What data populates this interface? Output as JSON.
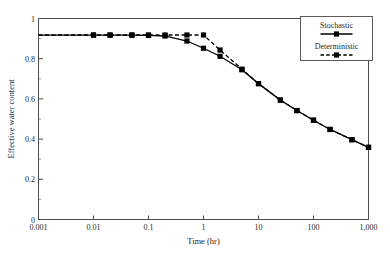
{
  "chart_data": {
    "type": "line",
    "title": "",
    "xlabel": "Time (hr)",
    "ylabel": "Effective water content",
    "xscale": "log",
    "yscale": "linear",
    "xlim": [
      0.001,
      1000
    ],
    "ylim": [
      0,
      1
    ],
    "grid": false,
    "legend_position": "top-right",
    "xticks": [
      0.001,
      0.01,
      0.1,
      1,
      10,
      100,
      1000
    ],
    "xticklabels": [
      "0.001",
      "0.01",
      "0.1",
      "1",
      "10",
      "100",
      "1,000"
    ],
    "yticks": [
      0,
      0.2,
      0.4,
      0.6,
      0.8,
      1
    ],
    "yticklabels": [
      "0",
      "0.2",
      "0.4",
      "0.6",
      "0.8",
      "1"
    ],
    "yminorticks": [
      0.1,
      0.3,
      0.5,
      0.7,
      0.9
    ],
    "series": [
      {
        "name": "Stochastic",
        "linestyle": "solid",
        "marker": "square",
        "color": "#000000",
        "x": [
          0.001,
          0.01,
          0.02,
          0.05,
          0.1,
          0.2,
          0.5,
          1,
          2,
          5,
          10,
          25,
          50,
          100,
          200,
          500,
          1000
        ],
        "y": [
          0.917,
          0.917,
          0.917,
          0.917,
          0.916,
          0.913,
          0.888,
          0.852,
          0.812,
          0.745,
          0.676,
          0.594,
          0.542,
          0.494,
          0.448,
          0.397,
          0.359
        ]
      },
      {
        "name": "Deterministic",
        "linestyle": "dashed",
        "marker": "square",
        "color": "#000000",
        "x": [
          0.001,
          0.01,
          0.02,
          0.05,
          0.1,
          0.2,
          0.5,
          1,
          2,
          5,
          10,
          25,
          50,
          100,
          200,
          500,
          1000
        ],
        "y": [
          0.918,
          0.918,
          0.918,
          0.918,
          0.918,
          0.918,
          0.918,
          0.918,
          0.843,
          0.748,
          0.676,
          0.594,
          0.542,
          0.494,
          0.448,
          0.397,
          0.359
        ]
      }
    ]
  },
  "legend": {
    "entries": [
      {
        "label": "Stochastic",
        "style": "solid"
      },
      {
        "label": "Deterministic",
        "style": "dashed"
      }
    ]
  }
}
